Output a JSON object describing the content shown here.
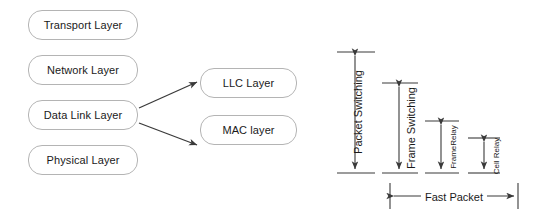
{
  "diagram": {
    "title_present": false,
    "background_color": "#ffffff",
    "line_color": "#3a3a3a",
    "box_border_color": "#b4b4b4",
    "text_color": "#1a1a1a",
    "osi_boxes": [
      {
        "id": "transport",
        "label": "Transport Layer",
        "x": 28,
        "y": 10,
        "w": 110,
        "h": 30
      },
      {
        "id": "network",
        "label": "Network Layer",
        "x": 28,
        "y": 55,
        "w": 110,
        "h": 30
      },
      {
        "id": "datalink",
        "label": "Data Link Layer",
        "x": 28,
        "y": 100,
        "w": 110,
        "h": 30
      },
      {
        "id": "physical",
        "label": "Physical Layer",
        "x": 28,
        "y": 145,
        "w": 110,
        "h": 30
      }
    ],
    "sublayer_boxes": [
      {
        "id": "llc",
        "label": "LLC Layer",
        "x": 200,
        "y": 68,
        "w": 97,
        "h": 30
      },
      {
        "id": "mac",
        "label": "MAC layer",
        "x": 200,
        "y": 115,
        "w": 97,
        "h": 30
      }
    ],
    "connectors": [
      {
        "from": "datalink",
        "to": "llc"
      },
      {
        "from": "datalink",
        "to": "mac"
      }
    ],
    "vertical_measures": [
      {
        "id": "packet-switching",
        "label": "Packet Switching",
        "size": "big",
        "lines": 1,
        "x": 355,
        "top": 52,
        "bottom": 173
      },
      {
        "id": "frame-switching",
        "label": "Frame Switching",
        "size": "big",
        "lines": 2,
        "x": 399,
        "top": 83,
        "bottom": 173
      },
      {
        "id": "frame-relay",
        "label": "FrameRelay",
        "size": "small",
        "lines": 1,
        "x": 441,
        "top": 121,
        "bottom": 173
      },
      {
        "id": "cell-relay",
        "label": "Cell Relay",
        "size": "small",
        "lines": 1,
        "x": 484,
        "top": 138,
        "bottom": 173
      }
    ],
    "horizontal_measure": {
      "id": "fast-packet",
      "label": "Fast Packet",
      "y": 196,
      "left": 390,
      "right": 518
    }
  }
}
